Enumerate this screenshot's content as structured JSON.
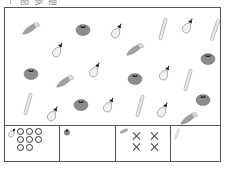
{
  "header": {
    "partial_text": "个 图 多 插"
  },
  "field": {
    "items": [
      {
        "type": "carrot",
        "x": 14,
        "y": 13,
        "rot": -35
      },
      {
        "type": "tomato",
        "x": 70,
        "y": 13
      },
      {
        "type": "eggplant",
        "x": 104,
        "y": 14,
        "rot": 30
      },
      {
        "type": "radish",
        "x": 153,
        "y": 9,
        "rot": 15
      },
      {
        "type": "eggplant",
        "x": 175,
        "y": 9,
        "rot": 30
      },
      {
        "type": "radish",
        "x": 205,
        "y": 10,
        "rot": 20
      },
      {
        "type": "eggplant",
        "x": 45,
        "y": 33,
        "rot": 30
      },
      {
        "type": "carrot",
        "x": 118,
        "y": 34,
        "rot": -35
      },
      {
        "type": "tomato",
        "x": 195,
        "y": 42
      },
      {
        "type": "tomato",
        "x": 18,
        "y": 57
      },
      {
        "type": "carrot",
        "x": 48,
        "y": 66,
        "rot": -35
      },
      {
        "type": "eggplant",
        "x": 82,
        "y": 53,
        "rot": 30
      },
      {
        "type": "tomato",
        "x": 122,
        "y": 62
      },
      {
        "type": "eggplant",
        "x": 152,
        "y": 56,
        "rot": 30
      },
      {
        "type": "radish",
        "x": 178,
        "y": 60,
        "rot": 15
      },
      {
        "type": "radish",
        "x": 18,
        "y": 84,
        "rot": 15
      },
      {
        "type": "eggplant",
        "x": 40,
        "y": 97,
        "rot": 30
      },
      {
        "type": "tomato",
        "x": 68,
        "y": 88
      },
      {
        "type": "eggplant",
        "x": 96,
        "y": 88,
        "rot": 30
      },
      {
        "type": "radish",
        "x": 130,
        "y": 86,
        "rot": 15
      },
      {
        "type": "eggplant",
        "x": 150,
        "y": 93,
        "rot": 30
      },
      {
        "type": "tomato",
        "x": 190,
        "y": 83
      },
      {
        "type": "carrot",
        "x": 172,
        "y": 103,
        "rot": -35
      }
    ]
  },
  "tally": {
    "cells": [
      {
        "name": "eggplant",
        "mark": "circle",
        "count": 8
      },
      {
        "name": "tomato",
        "mark": "none",
        "count": 0
      },
      {
        "name": "carrot",
        "mark": "cross",
        "count": 4
      },
      {
        "name": "radish",
        "mark": "none",
        "count": 0
      }
    ]
  },
  "colors": {
    "border": "#555555",
    "veg_gray": "#9a9a9a",
    "tomato": "#8a8a8a",
    "light": "#eeeeee"
  }
}
